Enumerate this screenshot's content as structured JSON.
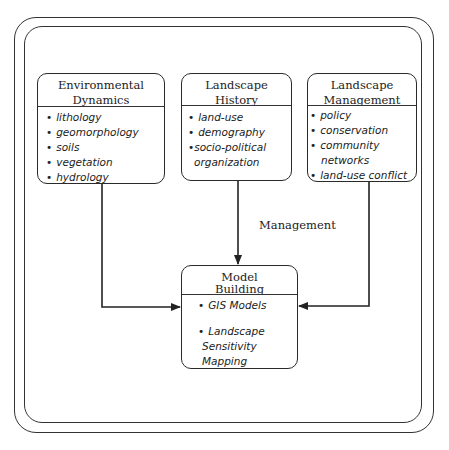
{
  "diagram": {
    "boxes": [
      {
        "id": "environmental-dynamics",
        "title": [
          "Environmental",
          "Dynamics"
        ],
        "items": [
          "lithology",
          "geomorphology",
          "soils",
          "vegetation",
          "hydrology"
        ]
      },
      {
        "id": "landscape-history",
        "title": [
          "Landscape",
          "History"
        ],
        "items": [
          "land-use",
          "demography",
          "socio-political",
          "organization"
        ]
      },
      {
        "id": "landscape-management",
        "title": [
          "Landscape",
          "Management"
        ],
        "items": [
          "policy",
          "conservation",
          "community",
          "networks",
          "land-use conflict"
        ]
      },
      {
        "id": "model-building",
        "title": [
          "Model",
          "Building"
        ],
        "items": [
          "GIS Models",
          "Landscape",
          "Sensitivity",
          "Mapping"
        ]
      }
    ],
    "edge_label": "Management",
    "edges": [
      {
        "from": "environmental-dynamics",
        "to": "model-building"
      },
      {
        "from": "landscape-history",
        "to": "model-building",
        "label": "Management"
      },
      {
        "from": "landscape-management",
        "to": "model-building"
      }
    ],
    "bullet": "•"
  }
}
